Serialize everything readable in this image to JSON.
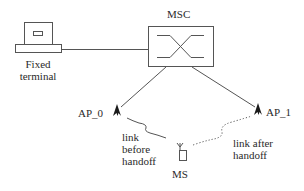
{
  "diagram": {
    "colors": {
      "stroke": "#555555",
      "text": "#2a2a2a",
      "antenna": "#1a1a1a",
      "background": "#ffffff"
    },
    "nodes": {
      "fixed_terminal": {
        "label_line1": "Fixed",
        "label_line2": "terminal",
        "icon": "computer-terminal-icon"
      },
      "msc": {
        "label": "MSC",
        "icon": "switch-crossover-icon"
      },
      "ap_0": {
        "label": "AP_0",
        "icon": "antenna-icon"
      },
      "ap_1": {
        "label": "AP_1",
        "icon": "antenna-icon"
      },
      "ms": {
        "label": "MS",
        "icon": "mobile-station-icon"
      }
    },
    "edges": [
      {
        "from": "fixed_terminal",
        "to": "msc",
        "style": "solid"
      },
      {
        "from": "msc",
        "to": "ap_0",
        "style": "solid"
      },
      {
        "from": "msc",
        "to": "ap_1",
        "style": "solid"
      },
      {
        "from": "ap_0",
        "to": "ms",
        "style": "wavy"
      },
      {
        "from": "ms",
        "to": "ap_1",
        "style": "dotted"
      }
    ],
    "annotations": {
      "link_before": {
        "line1": "link",
        "line2": "before",
        "line3": "handoff"
      },
      "link_after": {
        "line1": "link after",
        "line2": "handoff"
      }
    }
  }
}
